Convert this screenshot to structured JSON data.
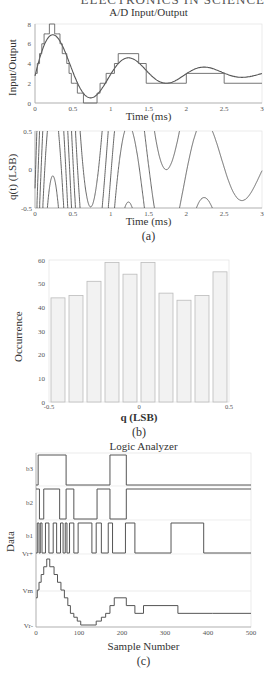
{
  "header": {
    "cutoff_text": "ELECTRONICS IN SCIENCE"
  },
  "chart_data": [
    {
      "id": "ad_io",
      "type": "line",
      "title": "A/D Input/Output",
      "xlabel": "Time (ms)",
      "ylabel": "Input/Output",
      "xlim": [
        0,
        3
      ],
      "ylim": [
        0,
        8
      ],
      "xticks": [
        "0",
        "0.5",
        "1",
        "1.5",
        "2",
        "2.5",
        "3"
      ],
      "yticks": [
        "0",
        "2",
        "4",
        "6",
        "8"
      ],
      "series": [
        {
          "name": "input (damped sinusoid)",
          "style": "smooth",
          "description": "3 + 5*exp(-t/0.8)*sin(2*pi*t) style decaying oscillation, peaks ~7.6 at t=0.22, min ~0 at t=0.72, 4.4 at t=1.25, 1.9 at t=1.72, 3.4 at t=2.22"
        },
        {
          "name": "quantized output",
          "style": "step",
          "x": [
            0,
            0.03,
            0.06,
            0.09,
            0.12,
            0.15,
            0.19,
            0.26,
            0.3,
            0.33,
            0.36,
            0.39,
            0.42,
            0.45,
            0.48,
            0.52,
            0.56,
            0.6,
            0.64,
            0.82,
            0.86,
            0.9,
            0.94,
            0.98,
            1.05,
            1.1,
            1.37,
            1.47,
            2.0,
            2.5,
            3.0
          ],
          "y": [
            3,
            4,
            5,
            6,
            7,
            7,
            8,
            7,
            7,
            6,
            5,
            5,
            4,
            3,
            2,
            2,
            1,
            1,
            0,
            1,
            2,
            2,
            3,
            3,
            4,
            5,
            4,
            2,
            3,
            2,
            2
          ]
        }
      ],
      "grid": false
    },
    {
      "id": "qt",
      "type": "line",
      "title": "",
      "xlabel": "Time (ms)",
      "ylabel": "q(t) (LSB)",
      "xlim": [
        0,
        3
      ],
      "ylim": [
        -0.5,
        0.5
      ],
      "xticks": [
        "0",
        "0.5",
        "1",
        "1.5",
        "2",
        "2.5",
        "3"
      ],
      "yticks": [
        "-0.5",
        "0",
        "0.5"
      ],
      "series": [
        {
          "name": "quantization error",
          "description": "sawtooth-like error between input and quantized output, rapid oscillation early, slower arcs later"
        }
      ],
      "caption": "(a)"
    },
    {
      "id": "hist",
      "type": "bar",
      "title": "",
      "xlabel": "q (LSB)",
      "ylabel": "Occurrence",
      "xlim": [
        -0.5,
        0.5
      ],
      "ylim": [
        0,
        60
      ],
      "xticks": [
        "-0.5",
        "0",
        "0.5"
      ],
      "yticks": [
        "0",
        "10",
        "20",
        "30",
        "40",
        "50",
        "60"
      ],
      "categories": [
        "-0.45",
        "-0.35",
        "-0.25",
        "-0.15",
        "-0.05",
        "0.05",
        "0.15",
        "0.25",
        "0.35",
        "0.45"
      ],
      "values": [
        44,
        45,
        51,
        59,
        54,
        59,
        46,
        43,
        45,
        55
      ],
      "bar_color": "#f2f2f2",
      "caption": "(b)"
    },
    {
      "id": "logic",
      "type": "line",
      "title": "Logic Analyzer",
      "xlabel": "Sample Number",
      "ylabel": "Data",
      "xlim": [
        0,
        500
      ],
      "xticks": [
        "0",
        "100",
        "200",
        "300",
        "400",
        "500"
      ],
      "row_labels": [
        "b3",
        "b2",
        "b1",
        "Vr+",
        "Vm",
        "Vr-"
      ],
      "digital": {
        "b3": {
          "transitions": [
            5,
            70,
            172,
            210
          ],
          "initial": 0
        },
        "b2": {
          "transitions": [
            8,
            18,
            55,
            70,
            88,
            142,
            172,
            210
          ],
          "initial": 1
        },
        "b1": {
          "transitions": [
            3,
            7,
            10,
            14,
            22,
            30,
            40,
            48,
            57,
            63,
            68,
            72,
            78,
            88,
            98,
            130,
            140,
            152,
            168,
            178,
            208,
            230,
            314,
            390
          ],
          "initial": 0
        }
      },
      "analog_steps": {
        "x": [
          0,
          3,
          7,
          12,
          18,
          25,
          32,
          42,
          50,
          58,
          66,
          74,
          80,
          88,
          96,
          104,
          140,
          152,
          162,
          172,
          182,
          210,
          230,
          250,
          330,
          410,
          500
        ],
        "level": [
          3,
          4,
          5,
          6,
          7,
          8,
          7,
          6,
          5,
          4,
          3,
          2,
          1,
          0.5,
          0,
          -0.5,
          0,
          0.5,
          1,
          2,
          3,
          2,
          1,
          2,
          1,
          1,
          1
        ]
      },
      "caption": "(c)"
    }
  ]
}
